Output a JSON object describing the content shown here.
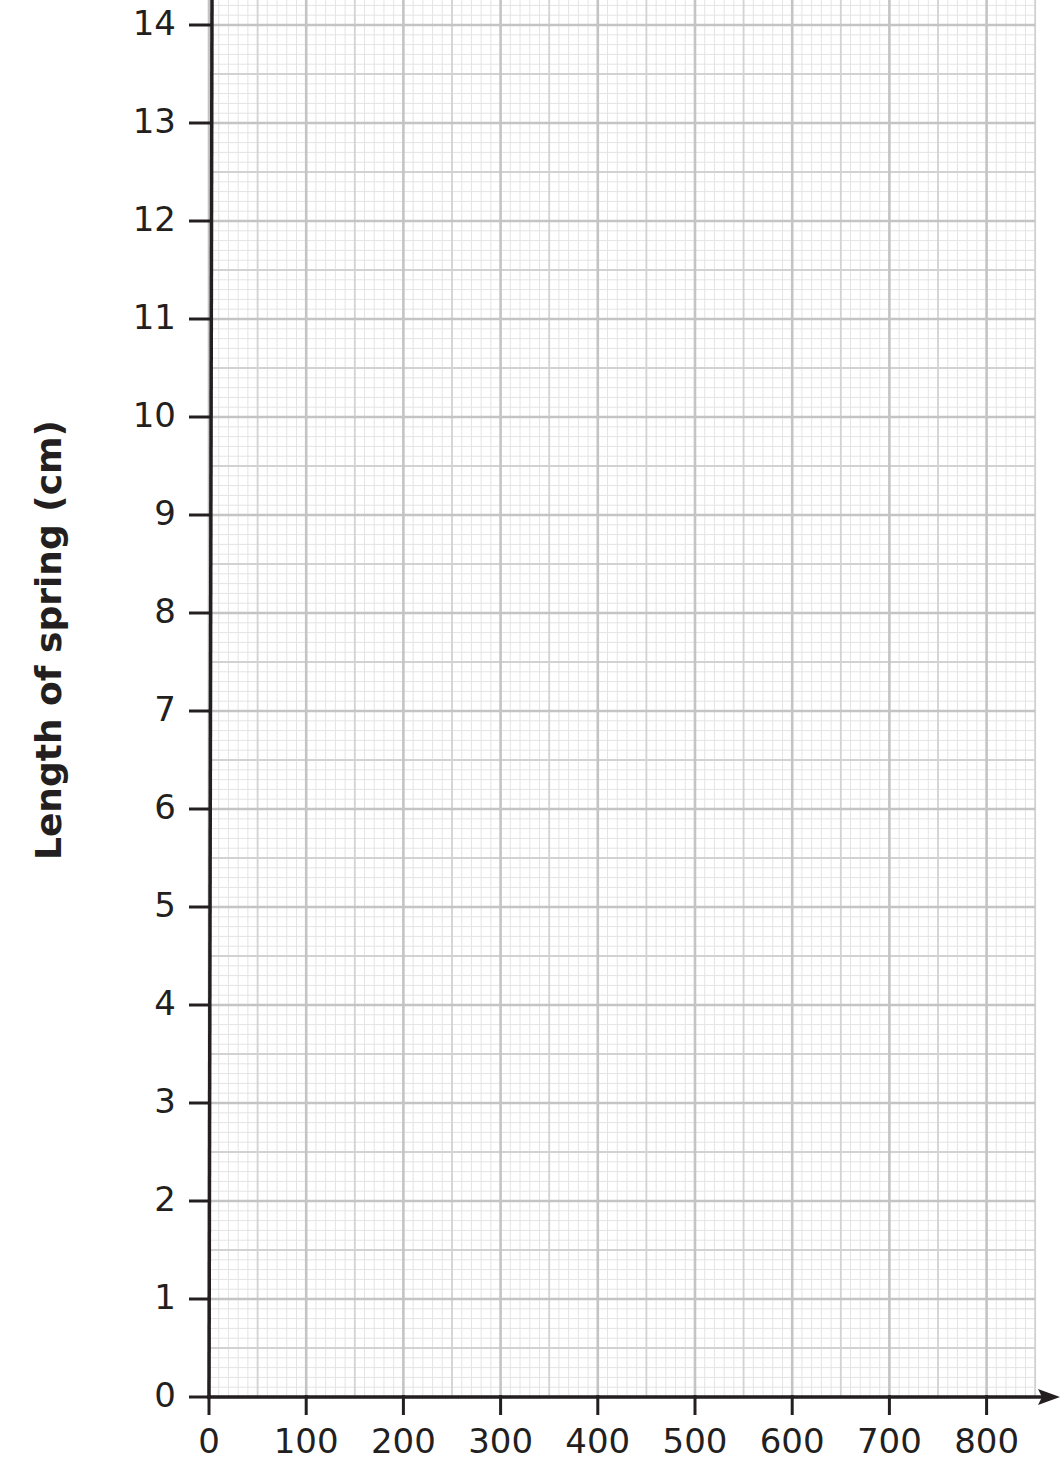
{
  "chart_data": {
    "type": "line",
    "title": "",
    "xlabel": "",
    "ylabel": "Length of spring (cm)",
    "x_ticks": [
      "0",
      "100",
      "200",
      "300",
      "400",
      "500",
      "600",
      "700",
      "800"
    ],
    "y_ticks": [
      "0",
      "1",
      "2",
      "3",
      "4",
      "5",
      "6",
      "7",
      "8",
      "9",
      "10",
      "11",
      "12",
      "13",
      "14"
    ],
    "xlim": [
      0,
      850
    ],
    "ylim": [
      0,
      14.25
    ],
    "grid": true,
    "grid_style": "graph paper: major lines every 100 (x) / 1 cm (y), mid lines every 50 / 0.5 cm, fine lines every 10 / 0.1 cm",
    "x_axis_arrow": true,
    "series": [],
    "legend": null
  },
  "colors": {
    "axis": "#231f20",
    "grid_major": "#c4c4c4",
    "grid_mid": "#d2d2d2",
    "grid_fine": "#e4e4e4"
  }
}
